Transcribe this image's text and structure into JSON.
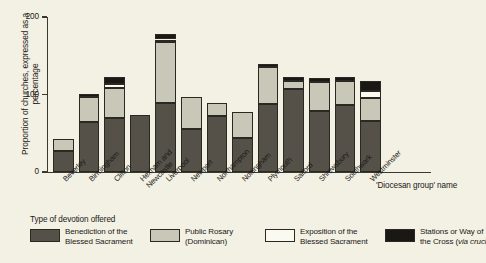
{
  "chart_data": {
    "type": "bar",
    "subtype": "stacked",
    "title": "",
    "xlabel": "'Diocesan group' name",
    "ylabel": "Proportion of churches, expressed as a percentage",
    "ylim": [
      0,
      200
    ],
    "yticks": [
      0,
      100,
      200
    ],
    "ytick_labels": [
      "0",
      "100",
      "200"
    ],
    "grid": false,
    "legend_position": "bottom",
    "legend_title": "Type of devotion offered",
    "categories": [
      "Beverley",
      "Birmingham",
      "Clifton",
      "Hexham and Newcastle",
      "Liverpool",
      "Newport",
      "Northampton",
      "Nottingham",
      "Plymouth",
      "Salford",
      "Shrewsbury",
      "Southwark",
      "Westminster"
    ],
    "category_lines": [
      [
        "Beverley",
        ""
      ],
      [
        "Birmingham",
        ""
      ],
      [
        "Clifton",
        ""
      ],
      [
        "Hexham and",
        "Newcastle"
      ],
      [
        "Liverpool",
        ""
      ],
      [
        "Newport",
        ""
      ],
      [
        "Northampton",
        ""
      ],
      [
        "Nottingham",
        ""
      ],
      [
        "Plymouth",
        ""
      ],
      [
        "Salford",
        ""
      ],
      [
        "Shrewsbury",
        ""
      ],
      [
        "Southwark",
        ""
      ],
      [
        "Westminster",
        ""
      ]
    ],
    "series": [
      {
        "name": "Benediction of the Blessed Sacrament",
        "name_lines": [
          "Benediction of the",
          "Blessed Sacrament"
        ],
        "color": "#555149",
        "values": [
          27,
          64,
          70,
          74,
          89,
          56,
          72,
          44,
          88,
          107,
          79,
          87,
          66
        ]
      },
      {
        "name": "Public Rosary (Dominican)",
        "name_lines": [
          "Public Rosary",
          "(Dominican)"
        ],
        "color": "#c9c7b8",
        "values": [
          16,
          33,
          38,
          0,
          79,
          41,
          17,
          34,
          47,
          10,
          37,
          30,
          29
        ]
      },
      {
        "name": "Exposition of the Blessed Sacrament",
        "name_lines": [
          "Exposition of the",
          "Blessed Sacrament"
        ],
        "color": "#fbfaf1",
        "values": [
          0,
          0,
          6,
          0,
          3,
          0,
          0,
          0,
          0,
          0,
          0,
          0,
          9
        ]
      },
      {
        "name": "Stations or Way of the Cross (via crucis)",
        "name_lines": [
          "Stations or Way of",
          "the Cross (via cruci"
        ],
        "name_italic": "via cruci",
        "color": "#191815",
        "values": [
          0,
          4,
          8,
          0,
          7,
          0,
          0,
          0,
          5,
          5,
          5,
          5,
          14
        ]
      }
    ],
    "totals": [
      43,
      101,
      122,
      74,
      178,
      97,
      89,
      78,
      140,
      122,
      121,
      122,
      118
    ]
  }
}
